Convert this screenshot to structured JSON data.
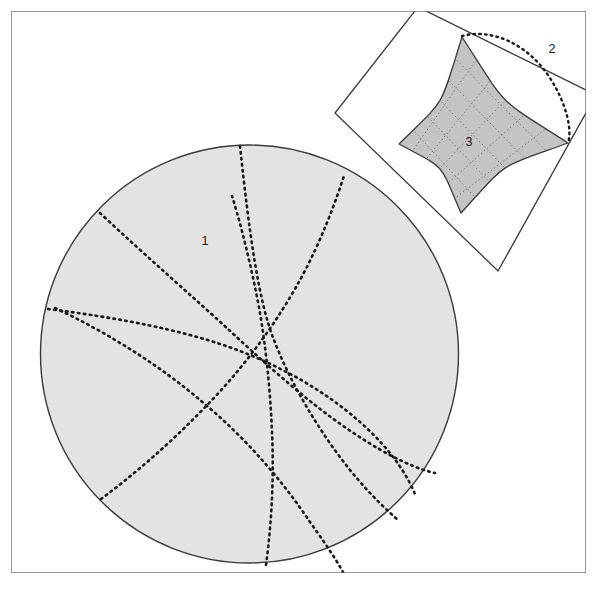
{
  "figure": {
    "background_color": "#ffffff",
    "frame": {
      "name": "outer-frame",
      "x": 11,
      "y": 11,
      "width": 575,
      "height": 562,
      "stroke": "#6e6e6e",
      "stroke_width": 1.4,
      "fill": "none"
    },
    "labels": [
      {
        "id": "label-1",
        "text": "1",
        "x": 205,
        "y": 242,
        "font_size": 12.5,
        "color": "#1a1a1a"
      },
      {
        "id": "label-2",
        "text": "2",
        "x": 552,
        "y": 50,
        "font_size": 12.5,
        "color": "#1a1a1a"
      },
      {
        "id": "label-3",
        "text": "3",
        "x": 469,
        "y": 143,
        "font_size": 12.5,
        "color": "#1a1a1a"
      }
    ],
    "colors": {
      "shaded_fill": "#e3e3e3",
      "inset_fill": "#c4c4c4",
      "outline_stroke": "#3a3a3a",
      "dotted_stroke": "#1a1a1a",
      "grid_stroke": "#777777",
      "frame_stroke": "#6e6e6e",
      "page_background": "#ffffff",
      "inset_panel_fill": "#ffffff"
    },
    "main_disk": {
      "name": "hyperbolic-disk",
      "center_x": 249.5,
      "center_y": 354,
      "radius": 209,
      "fill": "#e3e3e3",
      "stroke": "#3a3a3a",
      "stroke_width": 1.4,
      "label": "1"
    },
    "geodesics": {
      "description": "Six dotted circular-arc geodesics crossing the disk",
      "dash_pattern": "1.6 4.4",
      "stroke_width": 2.6,
      "stroke": "#1a1a1a",
      "paths": [
        "M 240,146 C 249,230 258,300 274,340 C 290,382 318,430 350,470 C 372,497 390,513 398,520",
        "M 100,213 C 148,258 192,296 229,330 C 268,366 310,404 352,432 C 392,459 420,470 435,473",
        "M 48,309 C 120,318 180,330 226,346 C 276,363 324,390 360,422 C 394,452 410,480 416,497",
        "M 101,499 C 140,470 178,436 212,400 C 248,362 278,320 300,280 C 322,240 336,200 344,176",
        "M 266,565 C 272,520 274,474 272,432 C 270,382 264,330 256,292 C 247,248 238,215 232,196",
        "M 55,308 C 110,334 160,366 200,400 C 244,436 282,480 310,522 C 330,550 340,566 344,574"
      ]
    },
    "inset": {
      "name": "inset-detail-panel",
      "label": "2",
      "panel": {
        "description": "Rotated square panel (white) clipped by outer frame",
        "points": "418,7 596,95 498,271 335,113",
        "fill": "#ffffff",
        "stroke": "#3a3a3a",
        "stroke_width": 1.3
      },
      "quadrilateral": {
        "name": "curvilinear-quadrilateral",
        "label": "3",
        "description": "Shaded ideal quadrilateral with four cusps and concave-in sides",
        "cusps": [
          {
            "id": "cusp-top",
            "x": 462,
            "y": 37
          },
          {
            "id": "cusp-right",
            "x": 568,
            "y": 143
          },
          {
            "id": "cusp-bottom",
            "x": 461,
            "y": 213
          },
          {
            "id": "cusp-left",
            "x": 399,
            "y": 144
          }
        ],
        "fill": "#c4c4c4",
        "stroke": "#3a3a3a",
        "stroke_width": 1.3
      },
      "grid": {
        "description": "Dotted coordinate grid inside the shaded quadrilateral",
        "dash_pattern": "1.3 2.6",
        "stroke": "#6f6f6f",
        "stroke_width": 1.0,
        "lines_per_direction": 5
      },
      "dotted_arc": {
        "name": "inset-dotted-boundary-arc",
        "description": "Dotted lens-shaped arc from top cusp to right cusp",
        "path": "M 462,36 C 492,28 528,44 550,78 C 568,106 572,132 568,143",
        "dash_pattern": "1.6 4.2",
        "stroke": "#1a1a1a",
        "stroke_width": 2.4
      }
    }
  }
}
